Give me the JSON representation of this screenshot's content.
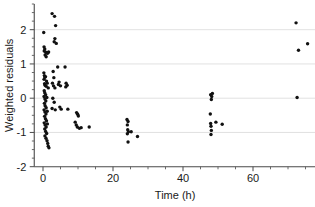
{
  "chart_data": {
    "type": "scatter",
    "title": "",
    "xlabel": "Time (h)",
    "ylabel": "Weighted residuals",
    "xlim": [
      -2.5,
      78
    ],
    "ylim": [
      -2.0,
      2.75
    ],
    "xticks": [
      0,
      20,
      40,
      60
    ],
    "yticks": [
      2,
      1,
      0,
      -1,
      -2
    ],
    "xtick_labels": [
      "0",
      "20",
      "40",
      "60"
    ],
    "ytick_labels": [
      "2",
      "1",
      "0",
      "-1",
      "-2"
    ],
    "grid": "horizontal",
    "legend": "none",
    "marker": "filled-circle",
    "marker_color": "#111111",
    "marker_size": 3.4,
    "points": [
      [
        0.2,
        1.92
      ],
      [
        0.3,
        1.5
      ],
      [
        0.5,
        1.44
      ],
      [
        0.35,
        1.38
      ],
      [
        0.8,
        1.34
      ],
      [
        1.1,
        1.33
      ],
      [
        0.6,
        1.26
      ],
      [
        0.9,
        1.21
      ],
      [
        1.3,
        1.31
      ],
      [
        1.6,
        1.35
      ],
      [
        2.6,
        2.47
      ],
      [
        3.3,
        2.39
      ],
      [
        3.6,
        2.12
      ],
      [
        3.4,
        1.74
      ],
      [
        3.8,
        1.6
      ],
      [
        3.2,
        1.65
      ],
      [
        0.25,
        0.74
      ],
      [
        0.4,
        0.66
      ],
      [
        0.55,
        0.61
      ],
      [
        0.3,
        0.55
      ],
      [
        0.7,
        0.63
      ],
      [
        1.0,
        0.5
      ],
      [
        0.45,
        0.42
      ],
      [
        0.6,
        0.38
      ],
      [
        0.9,
        0.35
      ],
      [
        1.2,
        0.44
      ],
      [
        1.5,
        0.3
      ],
      [
        0.35,
        0.22
      ],
      [
        0.5,
        0.16
      ],
      [
        0.75,
        0.1
      ],
      [
        0.3,
        0.05
      ],
      [
        0.55,
        -0.02
      ],
      [
        0.8,
        -0.08
      ],
      [
        1.1,
        0.02
      ],
      [
        0.4,
        -0.15
      ],
      [
        0.6,
        -0.22
      ],
      [
        0.9,
        -0.28
      ],
      [
        0.3,
        -0.34
      ],
      [
        0.55,
        -0.4
      ],
      [
        0.85,
        -0.46
      ],
      [
        1.2,
        -0.38
      ],
      [
        0.45,
        -0.53
      ],
      [
        0.7,
        -0.6
      ],
      [
        1.0,
        -0.66
      ],
      [
        0.35,
        -0.72
      ],
      [
        0.6,
        -0.78
      ],
      [
        0.9,
        -0.84
      ],
      [
        1.25,
        -0.75
      ],
      [
        0.5,
        -0.9
      ],
      [
        0.75,
        -0.97
      ],
      [
        1.05,
        -1.03
      ],
      [
        0.55,
        -1.1
      ],
      [
        0.85,
        -1.17
      ],
      [
        1.15,
        -1.24
      ],
      [
        1.35,
        -1.32
      ],
      [
        1.5,
        -1.4
      ],
      [
        1.7,
        -1.45
      ],
      [
        2.9,
        0.78
      ],
      [
        3.1,
        0.6
      ],
      [
        2.7,
        0.44
      ],
      [
        3.0,
        0.36
      ],
      [
        3.4,
        0.3
      ],
      [
        2.8,
        0.0
      ],
      [
        3.2,
        -0.12
      ],
      [
        2.6,
        -0.3
      ],
      [
        3.5,
        -0.34
      ],
      [
        4.2,
        0.91
      ],
      [
        4.6,
        0.47
      ],
      [
        4.4,
        0.4
      ],
      [
        5.0,
        0.36
      ],
      [
        4.8,
        -0.26
      ],
      [
        5.2,
        -0.32
      ],
      [
        6.3,
        0.91
      ],
      [
        6.6,
        0.44
      ],
      [
        6.9,
        0.38
      ],
      [
        6.5,
        0.33
      ],
      [
        7.1,
        -0.32
      ],
      [
        9.6,
        -0.42
      ],
      [
        9.9,
        -0.47
      ],
      [
        10.1,
        -0.52
      ],
      [
        9.2,
        -0.7
      ],
      [
        9.5,
        -0.78
      ],
      [
        9.8,
        -0.84
      ],
      [
        10.4,
        -0.88
      ],
      [
        10.9,
        -0.86
      ],
      [
        13.2,
        -0.84
      ],
      [
        24.0,
        -0.62
      ],
      [
        24.3,
        -0.68
      ],
      [
        24.1,
        -0.78
      ],
      [
        24.2,
        -0.92
      ],
      [
        24.4,
        -0.98
      ],
      [
        24.1,
        -1.04
      ],
      [
        25.2,
        -0.98
      ],
      [
        24.3,
        -1.28
      ],
      [
        27.0,
        -1.12
      ],
      [
        47.9,
        0.1
      ],
      [
        48.2,
        0.05
      ],
      [
        48.4,
        0.14
      ],
      [
        48.1,
        -0.04
      ],
      [
        47.8,
        -0.46
      ],
      [
        47.9,
        -0.74
      ],
      [
        48.0,
        -0.82
      ],
      [
        48.1,
        -0.94
      ],
      [
        48.0,
        -1.06
      ],
      [
        49.4,
        -0.7
      ],
      [
        51.2,
        -0.76
      ],
      [
        72.3,
        2.2
      ],
      [
        75.6,
        1.59
      ],
      [
        73.0,
        1.4
      ],
      [
        72.6,
        0.02
      ]
    ]
  }
}
